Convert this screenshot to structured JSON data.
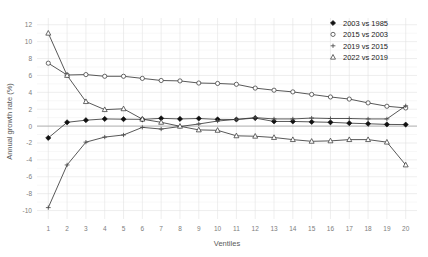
{
  "chart_data": {
    "type": "line",
    "title": "",
    "xlabel": "Ventiles",
    "ylabel": "Annual growth rate (%)",
    "x": [
      1,
      2,
      3,
      4,
      5,
      6,
      7,
      8,
      9,
      10,
      11,
      12,
      13,
      14,
      15,
      16,
      17,
      18,
      19,
      20
    ],
    "xticklabels": [
      "1",
      "2",
      "3",
      "4",
      "5",
      "6",
      "7",
      "8",
      "9",
      "10",
      "11",
      "12",
      "13",
      "14",
      "15",
      "16",
      "17",
      "18",
      "19",
      "20"
    ],
    "yticklabels": [
      "-10",
      "-8",
      "-6",
      "-4",
      "-2",
      "0",
      "2",
      "4",
      "6",
      "8",
      "10",
      "12"
    ],
    "yticks": [
      -10,
      -8,
      -6,
      -4,
      -2,
      0,
      2,
      4,
      6,
      8,
      10,
      12
    ],
    "ylim": [
      -11,
      12.8
    ],
    "xlim": [
      0.4,
      20.6
    ],
    "grid": true,
    "legend_position": "top-right",
    "series": [
      {
        "name": "2003 vs 1985",
        "marker": "filled-diamond",
        "values": [
          -1.4,
          0.45,
          0.7,
          0.85,
          0.82,
          0.8,
          0.92,
          0.85,
          0.9,
          0.8,
          0.78,
          0.95,
          0.55,
          0.55,
          0.5,
          0.45,
          0.35,
          0.28,
          0.2,
          0.18
        ]
      },
      {
        "name": "2015 vs 2003",
        "marker": "open-circle",
        "values": [
          7.45,
          6.05,
          6.1,
          5.9,
          5.9,
          5.65,
          5.4,
          5.35,
          5.1,
          5.05,
          4.95,
          4.5,
          4.25,
          4.05,
          3.75,
          3.45,
          3.2,
          2.75,
          2.35,
          2.15
        ]
      },
      {
        "name": "2019 vs 2015",
        "marker": "cross-bar",
        "values": [
          -9.65,
          -4.6,
          -1.9,
          -1.3,
          -1.05,
          -0.15,
          -0.35,
          -0.05,
          0.25,
          0.6,
          0.8,
          1.0,
          0.85,
          0.85,
          0.95,
          0.9,
          0.9,
          0.85,
          0.85,
          2.4
        ]
      },
      {
        "name": "2022 vs 2019",
        "marker": "open-triangle",
        "values": [
          11.0,
          6.0,
          2.9,
          1.95,
          2.05,
          0.82,
          0.45,
          -0.02,
          -0.45,
          -0.5,
          -1.15,
          -1.2,
          -1.35,
          -1.6,
          -1.8,
          -1.75,
          -1.6,
          -1.6,
          -1.9,
          -4.6
        ]
      }
    ]
  },
  "legend": {
    "items": [
      {
        "label": "2003 vs 1985",
        "marker": "filled-diamond"
      },
      {
        "label": "2015 vs 2003",
        "marker": "open-circle"
      },
      {
        "label": "2019 vs 2015",
        "marker": "cross-bar"
      },
      {
        "label": "2022 vs 2019",
        "marker": "open-triangle"
      }
    ]
  }
}
